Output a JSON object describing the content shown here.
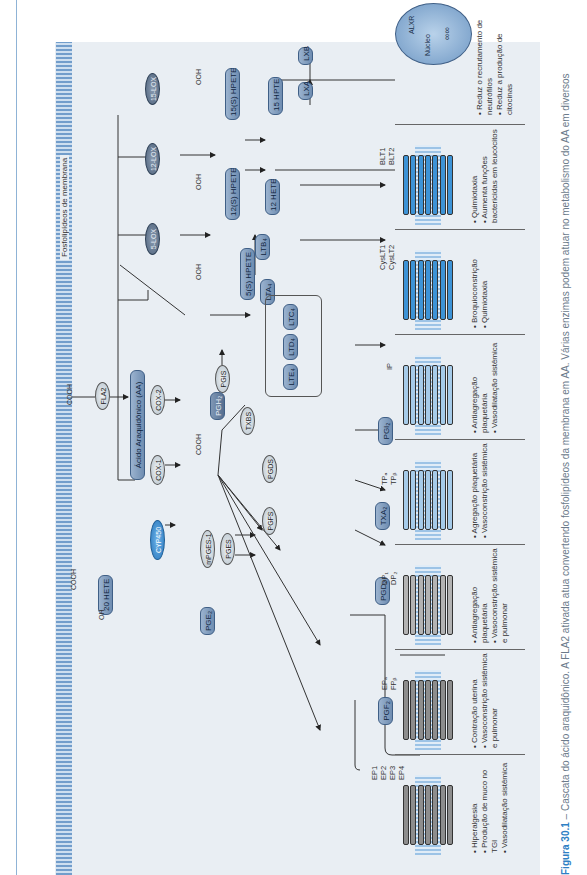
{
  "figure": {
    "membrane_label": "Fosfolipídeos de membrana",
    "caption_label": "Figura 30.1",
    "caption_text": " – Cascata do ácido araquidônico. A FLA2 ativada atua convertendo fosfolipídeos da membrana em AA. Várias enzimas podem atuar no metabolismo do AA em diversos"
  },
  "enzymes": {
    "fla2": "FLA2",
    "cyp450": "CYP450",
    "cox1": "COX-1",
    "cox2": "COX-2",
    "lox5": "5-LOX",
    "lox12": "12-LOX",
    "lox15": "15-LOX",
    "mpges1": "mPGES-1",
    "pges": "PGES",
    "pgis": "PGIS",
    "txbs": "TXBS",
    "pgds": "PGDS",
    "pgfs": "PGFS"
  },
  "metabolites": {
    "aa": "Ácido Araquidônico (AA)",
    "hete20": "20 HETE",
    "pgh2": "PGH₂",
    "pge2": "PGE₂",
    "pgd2": "PGD₂",
    "pgf2": "PGF₂",
    "txa2": "TXA₂",
    "pgi2": "PGI₂",
    "hpete5": "5(S) HPETE",
    "lta4": "LTA₄",
    "ltb4": "LTB₄",
    "ltc4": "LTC₄",
    "ltd4": "LTD₄",
    "lte4": "LTE₄",
    "hpete12": "12(S) HPETE",
    "hete12": "12 HETE",
    "hpete15": "15(S) HPETE",
    "hpte15": "15 HPTE",
    "lxa": "LXA",
    "lxb": "LXB"
  },
  "chem_labels": {
    "cooh": "COOH",
    "oh": "OH",
    "ooh": "OOH",
    "o": "O"
  },
  "receptors": [
    {
      "names": [
        "EP1",
        "EP2",
        "EP3",
        "EP4"
      ],
      "effects": [
        "Hiperalgesia",
        "Produção de muco no TGI",
        "Vasodilatação sistêmica"
      ]
    },
    {
      "names": [
        "EPₐ",
        "FPᵦ"
      ],
      "effects": [
        "Contração uterina",
        "Vasoconstrição sistêmica e pulmonar"
      ]
    },
    {
      "names": [
        "DP₁",
        "DP₂"
      ],
      "effects": [
        "Antiagregação plaquetária",
        "Vasoconstrição sistêmica e pulmonar"
      ]
    },
    {
      "names": [
        "TPₐ",
        "TPᵦ"
      ],
      "effects": [
        "Agregação plaquetária",
        "Vasoconstrição sistêmica"
      ]
    },
    {
      "names": [
        "IP"
      ],
      "effects": [
        "Antiagregação plaquetária",
        "Vasodilatação sistêmica"
      ]
    },
    {
      "names": [
        "CysLT1",
        "CysLT2"
      ],
      "effects": [
        "Broquioconstrição",
        "Quimiotaxia"
      ]
    },
    {
      "names": [
        "BLT1",
        "BLT2"
      ],
      "effects": [
        "Quimiotaxia",
        "Aumenta funções bactericidas em leucócitos"
      ]
    }
  ],
  "nucleus": {
    "label": "Núcleo",
    "receptor": "ALXR",
    "effects": [
      "Reduz o recrutamento de neutrófilos",
      "Reduz a produção de citocinas"
    ]
  }
}
